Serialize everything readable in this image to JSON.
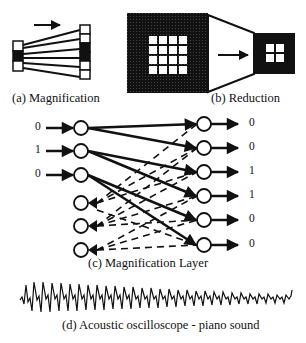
{
  "panels": {
    "magnification": {
      "caption": "(a) Magnification",
      "input_cells": [
        "white",
        "black",
        "white"
      ],
      "output_cells": [
        "white",
        "white",
        "black",
        "black",
        "white",
        "white"
      ]
    },
    "reduction": {
      "caption": "(b) Reduction",
      "large_grid": "4x4",
      "small_grid": "2x2"
    },
    "magnification_layer": {
      "caption": "(c) Magnification Layer",
      "inputs": [
        "0",
        "1",
        "0"
      ],
      "outputs": [
        "0",
        "0",
        "1",
        "1",
        "0",
        "0"
      ]
    },
    "oscilloscope": {
      "caption": "(d) Acoustic oscilloscope - piano sound"
    }
  },
  "colors": {
    "ink": "#111111",
    "background": "#ffffff"
  }
}
